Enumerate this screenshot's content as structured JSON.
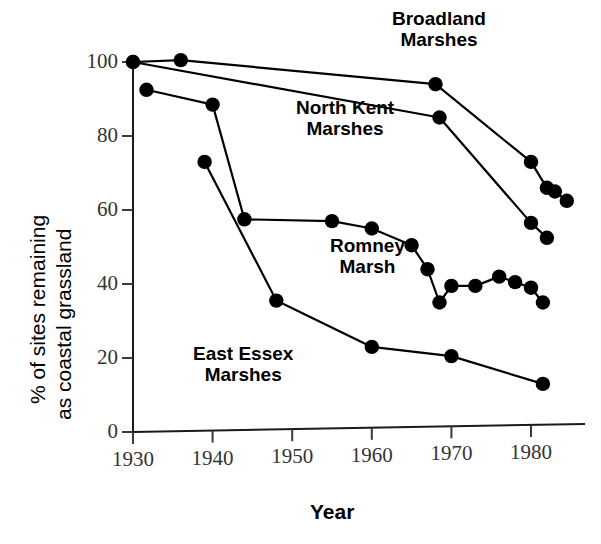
{
  "chart_data": {
    "type": "line",
    "title": "",
    "xlabel": "Year",
    "ylabel": "% of sites remaining as coastal grassland",
    "ylabel_line1": "% of sites remaining",
    "ylabel_line2": "as coastal grassland",
    "xlim": [
      1928,
      1588
    ],
    "x_range": [
      1928,
      1988
    ],
    "ylim": [
      0,
      105
    ],
    "grid": false,
    "legend_position": "inline-annotations",
    "xticks": [
      1930,
      1940,
      1950,
      1960,
      1970,
      1980
    ],
    "xtick_labels": [
      "1930",
      "1940",
      "1950",
      "1960",
      "1970",
      "1980"
    ],
    "yticks": [
      0,
      20,
      40,
      60,
      80,
      100
    ],
    "ytick_labels": [
      "0",
      "20",
      "40",
      "60",
      "80",
      "100"
    ],
    "series": [
      {
        "name": "Broadland Marshes",
        "label_line1": "Broadland",
        "label_line2": "Marshes",
        "x": [
          1930,
          1936,
          1968,
          1980,
          1982,
          1983,
          1984.5
        ],
        "values": [
          100,
          100.5,
          94,
          73,
          66,
          65,
          62.5
        ]
      },
      {
        "name": "North Kent Marshes",
        "label_line1": "North Kent",
        "label_line2": "Marshes",
        "x": [
          1930,
          1968.5,
          1980,
          1982
        ],
        "values": [
          100,
          85,
          56.5,
          52.5
        ]
      },
      {
        "name": "Romney Marsh",
        "label_line1": "Romney",
        "label_line2": "Marsh",
        "x": [
          1931.7,
          1940,
          1944,
          1955,
          1960,
          1965,
          1967,
          1968.5,
          1970,
          1973,
          1976,
          1978,
          1980,
          1981.5
        ],
        "values": [
          92.5,
          88.5,
          57.5,
          57,
          55,
          50.5,
          44,
          35,
          39.5,
          39.5,
          42,
          40.5,
          39,
          35
        ]
      },
      {
        "name": "East Essex Marshes",
        "label_line1": "East Essex",
        "label_line2": "Marshes",
        "x": [
          1939,
          1948,
          1960,
          1970,
          1981.5
        ],
        "values": [
          73,
          35.5,
          23,
          20.5,
          13
        ]
      }
    ]
  },
  "annotations": {
    "broadland": {
      "line1": "Broadland",
      "line2": "Marshes"
    },
    "north_kent": {
      "line1": "North Kent",
      "line2": "Marshes"
    },
    "romney": {
      "line1": "Romney",
      "line2": "Marsh"
    },
    "east_essex": {
      "line1": "East Essex",
      "line2": "Marshes"
    }
  },
  "colors": {
    "line": "#000000",
    "axis": "#1a1a1a",
    "text": "#000000",
    "tick_text": "#333333",
    "background": "#ffffff"
  }
}
